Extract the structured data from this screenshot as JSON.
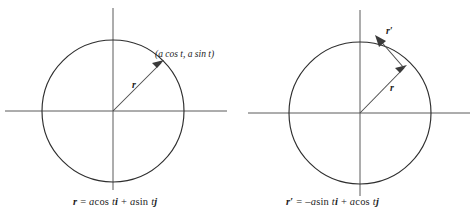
{
  "figure": {
    "panels": [
      {
        "id": "left",
        "name": "position-vector-panel",
        "point_label": "(a cos t, a sin t)",
        "vector_label": "r",
        "vector_label_prime": "",
        "equation": {
          "lhs": "r",
          "lhs_prime": "",
          "eq": "=",
          "term1_coef": "a",
          "term1_fn": "cos",
          "term1_var": "t",
          "term1_unit": "i",
          "plus": "+",
          "term2_coef": "a",
          "term2_fn": "sin",
          "term2_var": "t",
          "term2_unit": "j",
          "full_text": "r = a cos t i + a sin t j"
        },
        "geometry": {
          "center_x": 113,
          "center_y": 111,
          "radius": 71,
          "x_axis_start": 5,
          "x_axis_end": 227,
          "y_axis_start": 8,
          "y_axis_end": 190,
          "vector_angle_deg": 42
        }
      },
      {
        "id": "right",
        "name": "velocity-vector-panel",
        "point_label": "",
        "vector_label": "r",
        "vector_label_prime": "′",
        "tangent_label": "r",
        "tangent_label_prime": "′",
        "equation": {
          "lhs": "r",
          "lhs_prime": "′",
          "eq": "=",
          "minus": "–",
          "term1_coef": "a",
          "term1_fn": "sin",
          "term1_var": "t",
          "term1_unit": "i",
          "plus": "+",
          "term2_coef": "a",
          "term2_fn": "cos",
          "term2_var": "t",
          "term2_unit": "j",
          "full_text": "r′ = –a sin t i + a cos t j"
        },
        "geometry": {
          "center_x": 122,
          "center_y": 113,
          "radius": 71,
          "x_axis_start": 10,
          "x_axis_end": 232,
          "y_axis_start": 10,
          "y_axis_end": 196,
          "vector_angle_deg": 40,
          "tangent_angle_deg": 130
        }
      }
    ],
    "colors": {
      "axis": "#5b5b5b",
      "circle": "#2e2e2e",
      "vector": "#4a4a4a",
      "text": "#1d1d1d",
      "background": "#ffffff"
    }
  }
}
